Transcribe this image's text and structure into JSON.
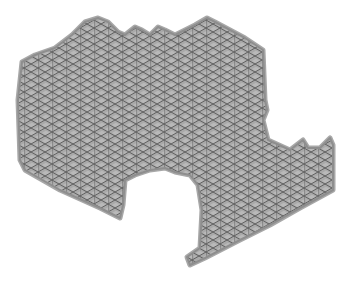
{
  "image": {
    "subject": "triangular infill lattice print shape",
    "width": 353,
    "height": 283,
    "background": "#ffffff"
  },
  "shape": {
    "fill_color": "#b9b9b9",
    "rim_color": "#8e8e8e",
    "rim_outer_color": "#a8a8a8",
    "grid_line_color": "#5f5f5f",
    "grid_shadow_color": "#a2a2a2",
    "grid_spacing_x": 14,
    "grid_spacing_y": 16,
    "outline_points": "22,62 35,55 55,48 72,35 85,22 98,18 108,22 118,32 125,35 135,27 142,30 150,35 158,27 165,30 175,35 195,25 207,18 215,22 245,38 263,50 265,100 267,110 263,120 268,140 290,150 303,140 308,148 320,148 330,138 333,145 333,190 300,208 270,225 240,240 205,258 190,265 187,257 200,248 202,210 198,185 190,175 175,172 165,168 150,170 135,175 125,180 123,205 120,218 100,208 60,190 25,170 20,160 18,100"
  }
}
